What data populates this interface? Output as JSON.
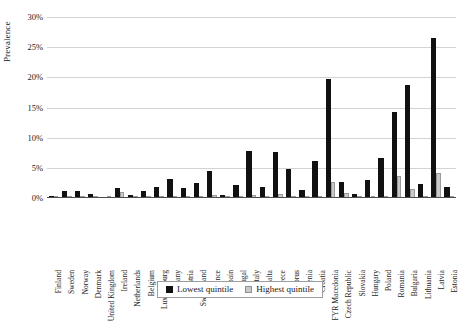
{
  "chart_data": {
    "type": "bar",
    "title": "",
    "xlabel": "",
    "ylabel": "Prevalence",
    "ylim": [
      0,
      30
    ],
    "y_tick_labels": [
      "0%",
      "5%",
      "10%",
      "15%",
      "20%",
      "25%",
      "30%"
    ],
    "y_tick_values": [
      0,
      5,
      10,
      15,
      20,
      25,
      30
    ],
    "grid": true,
    "legend_position": "bottom",
    "categories": [
      "Finland",
      "Sweden",
      "Norway",
      "Denmark",
      "United Kingdom",
      "Ireland",
      "Netherlands",
      "Belgium",
      "Luxembourg",
      "Germany",
      "Austria",
      "Switzerland",
      "France",
      "Spain",
      "Portugal",
      "Italy",
      "Malta",
      "Greece",
      "Cyprus",
      "Slovenia",
      "Croatia",
      "FYR Macedonia",
      "Czech Republic",
      "Slovakia",
      "Hungary",
      "Poland",
      "Romania",
      "Bulgaria",
      "Lithuania",
      "Latvia",
      "Estonia"
    ],
    "series": [
      {
        "name": "Lowest quintile",
        "color": "#111111",
        "values": [
          0.3,
          1.1,
          1.2,
          0.6,
          0.2,
          1.7,
          0.5,
          1.2,
          1.9,
          3.1,
          1.6,
          2.5,
          4.5,
          0.5,
          2.2,
          7.8,
          1.9,
          7.6,
          4.8,
          1.3,
          6.2,
          19.7,
          2.7,
          0.7,
          3.0,
          6.6,
          14.2,
          18.7,
          2.3,
          26.6,
          1.8
        ]
      },
      {
        "name": "Highest quintile",
        "color": "#c9c9c9",
        "values": [
          0.0,
          0.1,
          0.1,
          0.0,
          0.0,
          1.0,
          0.1,
          0.1,
          0.2,
          0.2,
          0.2,
          0.3,
          0.5,
          0.0,
          0.2,
          0.5,
          0.1,
          0.6,
          0.3,
          0.1,
          0.4,
          2.6,
          0.8,
          0.1,
          0.4,
          0.3,
          3.7,
          1.5,
          0.3,
          4.2,
          0.2
        ]
      }
    ]
  },
  "legend": {
    "items": [
      {
        "label": "Lowest quintile"
      },
      {
        "label": "Highest quintile"
      }
    ]
  }
}
